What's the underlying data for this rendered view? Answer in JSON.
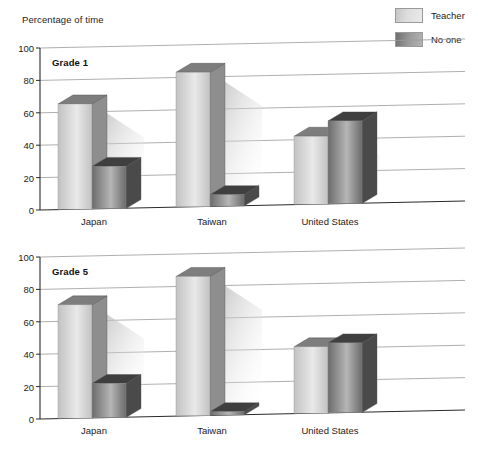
{
  "chart_data": {
    "type": "bar",
    "title": "",
    "xlabel": "",
    "ylabel": "Percentage of time",
    "ylim": [
      0,
      100
    ],
    "yticks": [
      0,
      20,
      40,
      60,
      80,
      100
    ],
    "categories": [
      "Japan",
      "Taiwan",
      "United States"
    ],
    "legend": [
      "Teacher",
      "No one"
    ],
    "legend_position": "top-right",
    "grid": true,
    "panels": [
      {
        "label": "Grade 1",
        "categories": [
          "Japan",
          "Taiwan",
          "United States"
        ],
        "series": [
          {
            "name": "Teacher",
            "values": [
              65,
              83,
              42
            ]
          },
          {
            "name": "No one",
            "values": [
              26,
              7,
              51
            ]
          }
        ]
      },
      {
        "label": "Grade 5",
        "categories": [
          "Japan",
          "Taiwan",
          "United States"
        ],
        "series": [
          {
            "name": "Teacher",
            "values": [
              70,
              86,
              41
            ]
          },
          {
            "name": "No one",
            "values": [
              21,
              2,
              43
            ]
          }
        ]
      }
    ],
    "colors": {
      "teacher_face_light": "#e9e9e9",
      "teacher_face_dark": "#c2c2c2",
      "teacher_side": "#8e8e8e",
      "teacher_top": "#7d7d7d",
      "noone_face_light": "#b6b6b6",
      "noone_face_dark": "#6b6b6b",
      "noone_side": "#4a4a4a",
      "noone_top": "#3f3f3f",
      "gridline": "#9a9a9a",
      "axis": "#2a2a2a",
      "shadow": "#c9c9c9",
      "background": "#ffffff"
    }
  },
  "axis_title": "Percentage of time",
  "legend": {
    "items": [
      {
        "label": "Teacher",
        "swatch": "teacher"
      },
      {
        "label": "No one",
        "swatch": "noone"
      }
    ]
  },
  "panels": {
    "grade1": {
      "title": "Grade 1",
      "yticks": [
        "100",
        "80",
        "60",
        "40",
        "20",
        "0"
      ],
      "xlabels": [
        "Japan",
        "Taiwan",
        "United States"
      ]
    },
    "grade5": {
      "title": "Grade 5",
      "yticks": [
        "100",
        "80",
        "60",
        "40",
        "20",
        "0"
      ],
      "xlabels": [
        "Japan",
        "Taiwan",
        "United States"
      ]
    }
  }
}
